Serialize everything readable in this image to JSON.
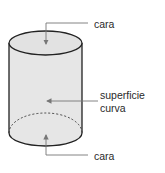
{
  "diagram": {
    "shape": "cylinder",
    "labels": {
      "top_face": "cara",
      "curved_surface_line1": "superficie",
      "curved_surface_line2": "curva",
      "bottom_face": "cara"
    },
    "colors": {
      "fill": "#e6e6e6",
      "outline": "#222222",
      "leader": "#777777"
    }
  }
}
